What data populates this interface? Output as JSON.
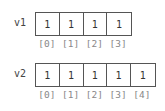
{
  "vectors": [
    {
      "label": "v1",
      "values": [
        "1",
        "1",
        "1",
        "1"
      ],
      "indices": [
        "[0]",
        "[1]",
        "[2]",
        "[3]"
      ]
    },
    {
      "label": "v2",
      "values": [
        "1",
        "1",
        "1",
        "1",
        "1"
      ],
      "indices": [
        "[0]",
        "[1]",
        "[2]",
        "[3]",
        "[4]"
      ]
    }
  ],
  "colors": {
    "border": "#555555",
    "value_text": "#333333",
    "index_text": "#888888",
    "label_text": "#444444"
  }
}
